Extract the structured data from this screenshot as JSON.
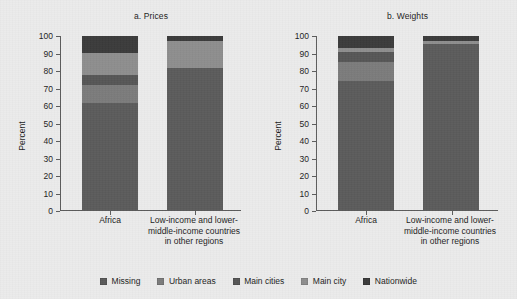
{
  "figure": {
    "background_color": "#ebebeb",
    "axis_color": "#5c5c5c"
  },
  "legend": {
    "position": "bottom-center",
    "items": [
      {
        "label": "Missing",
        "color": "#5b5b5b",
        "name": "legend-item-missing"
      },
      {
        "label": "Urban areas",
        "color": "#7b7b7b",
        "name": "legend-item-urban-areas"
      },
      {
        "label": "Main cities",
        "color": "#565656",
        "name": "legend-item-main-cities"
      },
      {
        "label": "Main city",
        "color": "#8e8e8e",
        "name": "legend-item-main-city"
      },
      {
        "label": "Nationwide",
        "color": "#3b3b3b",
        "name": "legend-item-nationwide"
      }
    ]
  },
  "panels": [
    {
      "id": "a",
      "title": "a. Prices",
      "ylabel": "Percent",
      "ticks": [
        "0",
        "10",
        "20",
        "30",
        "40",
        "50",
        "60",
        "70",
        "80",
        "90",
        "100"
      ],
      "categories": [
        "Africa",
        "Low-income and lower-middle-income countries in other regions"
      ]
    },
    {
      "id": "b",
      "title": "b. Weights",
      "ylabel": "Percent",
      "ticks": [
        "0",
        "10",
        "20",
        "30",
        "40",
        "50",
        "60",
        "70",
        "80",
        "90",
        "100"
      ],
      "categories": [
        "Africa",
        "Low-income and lower-middle-income countries in other regions"
      ]
    }
  ],
  "chart_data": [
    {
      "type": "bar",
      "stacked": true,
      "title": "a. Prices",
      "xlabel": "",
      "ylabel": "Percent",
      "ylim": [
        0,
        100
      ],
      "yticks": [
        0,
        10,
        20,
        30,
        40,
        50,
        60,
        70,
        80,
        90,
        100
      ],
      "grid": false,
      "legend_position": "bottom-center",
      "categories": [
        "Africa",
        "Low-income and lower-middle-income countries in other regions"
      ],
      "series": [
        {
          "name": "Missing",
          "color": "#5b5b5b",
          "values": [
            62.0,
            81.5
          ]
        },
        {
          "name": "Urban areas",
          "color": "#7b7b7b",
          "values": [
            10.0,
            0.0
          ]
        },
        {
          "name": "Main cities",
          "color": "#565656",
          "values": [
            6.0,
            0.0
          ]
        },
        {
          "name": "Main city",
          "color": "#8e8e8e",
          "values": [
            12.5,
            15.5
          ]
        },
        {
          "name": "Nationwide",
          "color": "#3b3b3b",
          "values": [
            9.5,
            3.0
          ]
        }
      ]
    },
    {
      "type": "bar",
      "stacked": true,
      "title": "b. Weights",
      "xlabel": "",
      "ylabel": "Percent",
      "ylim": [
        0,
        100
      ],
      "yticks": [
        0,
        10,
        20,
        30,
        40,
        50,
        60,
        70,
        80,
        90,
        100
      ],
      "grid": false,
      "legend_position": "bottom-center",
      "categories": [
        "Africa",
        "Low-income and lower-middle-income countries in other regions"
      ],
      "series": [
        {
          "name": "Missing",
          "color": "#5b5b5b",
          "values": [
            74.5,
            95.5
          ]
        },
        {
          "name": "Urban areas",
          "color": "#7b7b7b",
          "values": [
            10.5,
            0.0
          ]
        },
        {
          "name": "Main cities",
          "color": "#565656",
          "values": [
            6.0,
            0.0
          ]
        },
        {
          "name": "Main city",
          "color": "#8e8e8e",
          "values": [
            2.0,
            1.5
          ]
        },
        {
          "name": "Nationwide",
          "color": "#3b3b3b",
          "values": [
            7.0,
            3.0
          ]
        }
      ]
    }
  ]
}
